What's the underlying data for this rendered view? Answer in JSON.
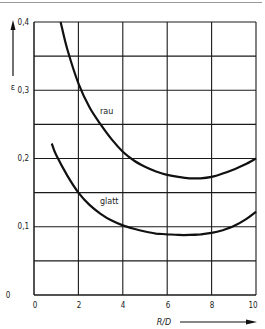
{
  "chart_data": {
    "type": "line",
    "title": "",
    "xlabel": "R/D",
    "ylabel": "ε",
    "xlim": [
      0,
      10
    ],
    "ylim": [
      0,
      0.4
    ],
    "x_ticks": [
      "0",
      "2",
      "4",
      "6",
      "8",
      "10"
    ],
    "y_ticks": [
      "0",
      "0,1",
      "0,2",
      "0,3",
      "0,4"
    ],
    "grid": true,
    "grid_x_step": 2,
    "grid_y_step": 0.05,
    "legend": "inline labels on curves",
    "series": [
      {
        "name": "rau",
        "x": [
          1.2,
          1.5,
          2.0,
          2.5,
          3.0,
          3.5,
          4.0,
          4.5,
          5.0,
          5.5,
          6.0,
          6.5,
          7.0,
          7.5,
          8.0,
          8.5,
          9.0,
          9.5,
          10.0
        ],
        "y": [
          0.4,
          0.36,
          0.31,
          0.275,
          0.25,
          0.228,
          0.21,
          0.197,
          0.188,
          0.181,
          0.176,
          0.173,
          0.171,
          0.171,
          0.173,
          0.178,
          0.184,
          0.191,
          0.2
        ]
      },
      {
        "name": "glatt",
        "x": [
          0.8,
          1.0,
          1.5,
          2.0,
          2.5,
          3.0,
          3.5,
          4.0,
          4.5,
          5.0,
          5.5,
          6.0,
          6.5,
          7.0,
          7.5,
          8.0,
          8.5,
          9.0,
          9.5,
          10.0
        ],
        "y": [
          0.222,
          0.205,
          0.175,
          0.15,
          0.132,
          0.119,
          0.109,
          0.102,
          0.097,
          0.093,
          0.09,
          0.089,
          0.088,
          0.088,
          0.089,
          0.091,
          0.095,
          0.101,
          0.11,
          0.122
        ]
      }
    ]
  },
  "labels": {
    "y_axis_symbol": "ε",
    "x_axis_label": "R/D",
    "curve_rau": "rau",
    "curve_glatt": "glatt",
    "y0": "0",
    "y1": "0,1",
    "y2": "0,2",
    "y3": "0,3",
    "y4": "0,4",
    "x0": "0",
    "x2": "2",
    "x4": "4",
    "x6": "6",
    "x8": "8",
    "x10": "10"
  }
}
